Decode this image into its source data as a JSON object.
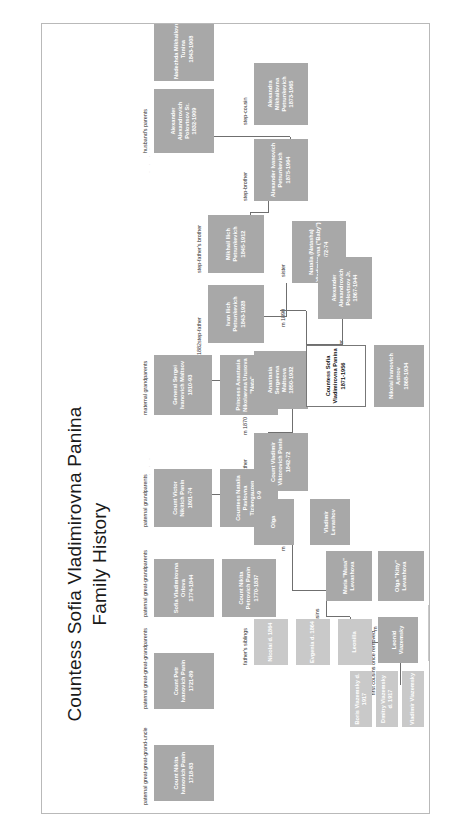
{
  "document": {
    "title_line1": "Countess Sofia Vladimirovna Panina",
    "title_line2": "Family History",
    "watermark": "· · · ·"
  },
  "group_labels": {
    "paternal_great_great_grandparents": "paternal great-great-grandparents",
    "paternal_great_great_grand_uncle": "paternal great-great-grand-uncle",
    "paternal_great_grandparents": "paternal great-grandparents",
    "paternal_grandparents": "paternal grandparents",
    "maternal_grandparents": "maternal grandparents",
    "husbands_parents": "husband's parents",
    "stepfathers_brother": "step-father's brother",
    "stepfather": "step-father",
    "stepbrother": "step-brother",
    "stepcousin": "step-cousin",
    "sister": "sister",
    "mother": "mother",
    "father": "father",
    "partner": "partner",
    "fathers_siblings": "father's siblings",
    "first_cousins": "first cousins",
    "first_cousins_once_removed": "first cousins once removed"
  },
  "marriages": {
    "m1882": "m 1882",
    "m1870": "m 1870",
    "m1890": "m 1890",
    "m_olga": "m",
    "m_musa": "m"
  },
  "people": {
    "ivanovich_panin_uncle": {
      "name": "Count Nikita\nIvanovich Panin",
      "years": "1718-83"
    },
    "petr_ivanovich_panin": {
      "name": "Count Petr\nIvanovich Panin",
      "years": "1721-89"
    },
    "sofia_vladimirovna_orlova": {
      "name": "Sofia Vladimirovna\nOrlova",
      "years": "1774-1844"
    },
    "count_nikita_petrovich_panin": {
      "name": "Count Nikita\nPetrovich Panin",
      "years": "1770-1837"
    },
    "count_victor_nikitich_panin": {
      "name": "Count Victor\nNikitich Panin",
      "years": "1801-74"
    },
    "countess_natalia_tiziengauzen": {
      "name": "Countess Natalia\nPavlovna Tiziengauzen",
      "years": "1810-99"
    },
    "general_sergei_maltsov": {
      "name": "General Sergei\nIvanovich Maltsov",
      "years": "1810-93"
    },
    "princess_anastasia_urusova": {
      "name": "Princess Anastasia\nNikolaevna Urusova \"Nata\"",
      "years": "1820-94"
    },
    "alexander_polovtsov_sr": {
      "name": "Alexander Alexandrovich\nPolovtsov Sr.",
      "years": "1832-1909"
    },
    "nadezhda_tunina": {
      "name": "Nadezhda Mikhailovna\nTunina",
      "years": "1843-1908"
    },
    "mikhail_petrunkevich": {
      "name": "Mikhail Ilich\nPetrunkevich",
      "years": "1845-1912"
    },
    "ivan_petrunkevich": {
      "name": "Ivan Ilich\nPetrunkevich",
      "years": "1843-1928"
    },
    "alexandra_petrunkevich": {
      "name": "Alexandra Mikhailovna\nPetrunkevich",
      "years": "1873-1965"
    },
    "alexander_petrunkevich": {
      "name": "Alexander Ivanovich\nPetrunkevich",
      "years": "1875-1964"
    },
    "natalia_panina_baby": {
      "name": "Natalia (Natasha)\nVladimirovna (\"Baby\")",
      "years": "1872-74"
    },
    "anastasia_maltsova": {
      "name": "Anastasia Sergeevna\nMaltsova",
      "years": "1850-1932"
    },
    "count_vladimir_panin": {
      "name": "Count Vladimir\nViktorovich Panin",
      "years": "1842-72"
    },
    "sofia_panina": {
      "name": "Countess Sofia\nVladimirovna Panina",
      "years": "1871-1956"
    },
    "alexander_polovtsov_jr": {
      "name": "Alexander Alexandrovich\nPolovtsov Jr.",
      "years": "1867-1944"
    },
    "nikolai_astrov": {
      "name": "Nikolai Ivanovich\nAstrov",
      "years": "1868-1934"
    },
    "olga_panina": {
      "name": "Olga",
      "years": ""
    },
    "vladimir_levashov": {
      "name": "Vladimir Levashov",
      "years": ""
    },
    "nikolai_panin": {
      "name": "Nicolai d. 1864",
      "years": ""
    },
    "evgenia_panina": {
      "name": "Evgenia d. 1864",
      "years": ""
    },
    "leonilla_panina": {
      "name": "Leonilla",
      "years": ""
    },
    "maria_musa_levashova": {
      "name": "Maria \"Musa\"\nLevashova",
      "years": ""
    },
    "olga_kitty_levashova": {
      "name": "Olga \"Kitty\"\nLevashova",
      "years": ""
    },
    "leonid_viazemsky": {
      "name": "Leonid\nViazemsky",
      "years": ""
    },
    "boris_viazemsky": {
      "name": "Boris Viazemsky d. 1917",
      "years": ""
    },
    "dmitry_viazemsky": {
      "name": "Dmitry Viazemsky d. 1917",
      "years": ""
    },
    "vladimir_viazemsky": {
      "name": "Vladimir Viazemsky",
      "years": ""
    },
    "lidia_viazemskaya": {
      "name": "Lidia Viazishkova\n1886-1948",
      "years": ""
    }
  }
}
